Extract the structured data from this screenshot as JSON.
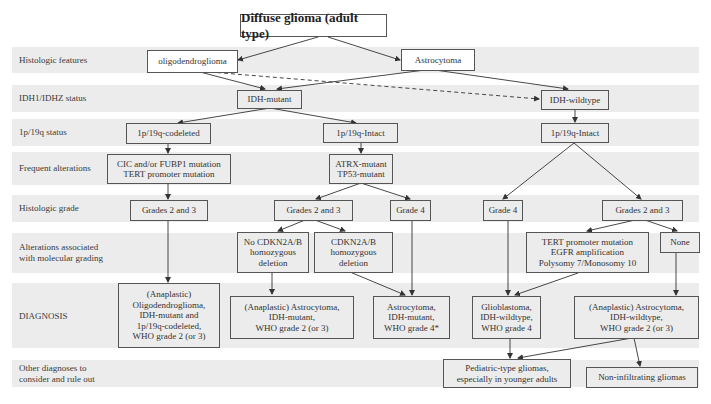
{
  "title": "Diffuse glioma (adult type)",
  "rows": [
    {
      "label": "Histologic features"
    },
    {
      "label": "IDH1/IDHZ status"
    },
    {
      "label": "1p/19q status"
    },
    {
      "label": "Frequent alterations"
    },
    {
      "label": "Histologic grade"
    },
    {
      "label": "Alterations associated\nwith molecular grading"
    },
    {
      "label": "DIAGNOSIS"
    },
    {
      "label": "Other diagnoses to\nconsider and rule out"
    }
  ],
  "nodes": {
    "oligodendroglioma": "oligodendroglioma",
    "astrocytoma": "Astrocytoma",
    "idh_mutant": "IDH-mutant",
    "idh_wildtype": "IDH-wildtype",
    "codeleted": "1p/19q-codeleted",
    "intact_mid": "1p/19q-Intact",
    "intact_right": "1p/19q-Intact",
    "cic": "CIC and/or FUBP1 mutation\nTERT promoter mutation",
    "atrx": "ATRX-mutant\nTP53-mutant",
    "grades23_left": "Grades 2 and 3",
    "grades23_mid": "Grades 2 and 3",
    "grade4_mid": "Grade 4",
    "grade4_right": "Grade 4",
    "grades23_right": "Grades 2 and 3",
    "no_cdkn": "No CDKN2A/B\nhomozygous\ndeletion",
    "cdkn": "CDKN2A/B\nhomozygous\ndeletion",
    "tert_egfr": "TERT promoter mutation\nEGFR amplification\nPolysomy 7/Monosomy 10",
    "none": "None",
    "dx_oligo": "(Anaplastic)\nOligodendroglioma,\nIDH-mutant and\n1p/19q-codeleted,\nWHO grade 2 (or 3)",
    "dx_astro_mut": "(Anaplastic) Astrocytoma,\nIDH-mutant,\nWHO grade 2 (or 3)",
    "dx_astro_mut4": "Astrocytoma,\nIDH-mutant,\nWHO grade 4*",
    "dx_gbm": "Glioblastoma,\nIDH-wildtype,\nWHO grade 4",
    "dx_astro_wt": "(Anaplastic) Astrocytoma,\nIDH-wildtype,\nWHO grade 2 (or 3)",
    "pediatric": "Pediatric-type gliomas,\nespecially in younger adults",
    "non_infiltrating": "Non-infiltrating gliomas"
  },
  "colors": {
    "band": "#ececec",
    "border": "#555555",
    "arrow": "#333333"
  }
}
